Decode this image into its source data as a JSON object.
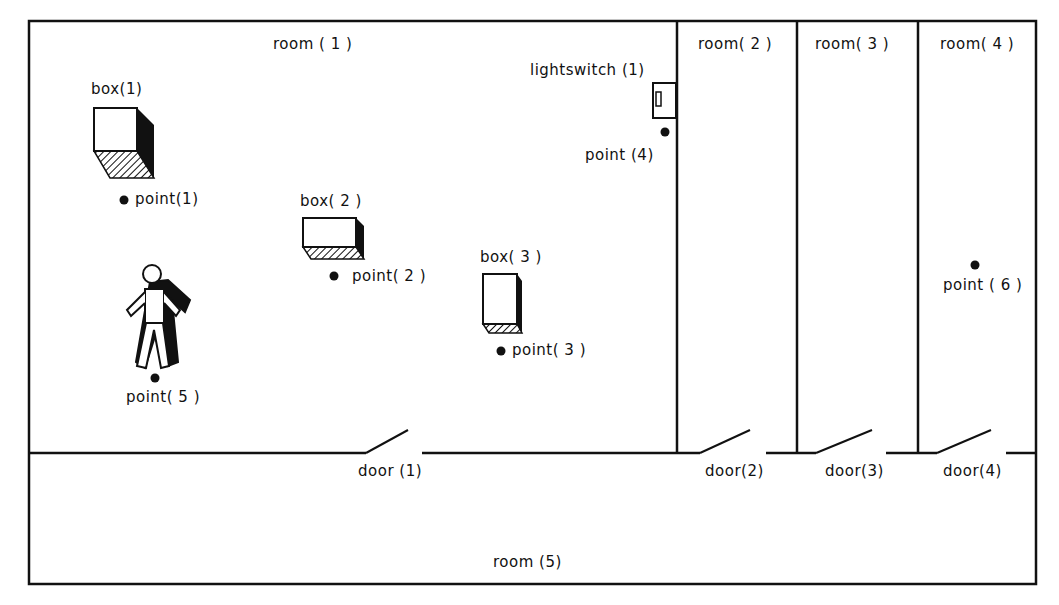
{
  "rooms": [
    {
      "label": "room ( 1 )"
    },
    {
      "label": "room( 2 )"
    },
    {
      "label": "room( 3 )"
    },
    {
      "label": "room( 4 )"
    },
    {
      "label": "room (5)"
    }
  ],
  "doors": [
    {
      "label": "door (1)"
    },
    {
      "label": "door(2)"
    },
    {
      "label": "door(3)"
    },
    {
      "label": "door(4)"
    }
  ],
  "boxes": [
    {
      "label": "box(1)"
    },
    {
      "label": "box( 2 )"
    },
    {
      "label": "box( 3 )"
    }
  ],
  "points": [
    {
      "label": "point(1)"
    },
    {
      "label": "point( 2 )"
    },
    {
      "label": "point( 3 )"
    },
    {
      "label": "point (4)"
    },
    {
      "label": "point( 5 )"
    },
    {
      "label": "point ( 6 )"
    }
  ],
  "lightswitch": {
    "label": "lightswitch (1)"
  },
  "colors": {
    "ink": "#111111",
    "background": "#ffffff"
  }
}
